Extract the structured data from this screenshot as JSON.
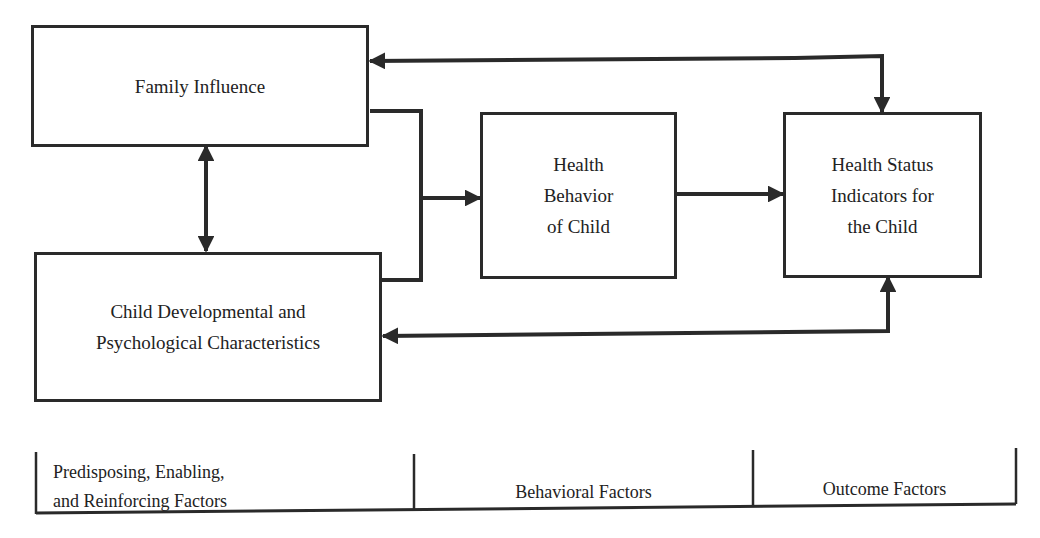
{
  "diagram": {
    "boxes": {
      "family_influence": {
        "lines": [
          "Family Influence"
        ]
      },
      "child_characteristics": {
        "lines": [
          "Child Developmental and",
          "Psychological Characteristics"
        ]
      },
      "health_behavior": {
        "lines": [
          "Health",
          "Behavior",
          "of Child"
        ]
      },
      "health_status": {
        "lines": [
          "Health Status",
          "Indicators for",
          "the Child"
        ]
      }
    },
    "edges": [
      {
        "from": "family_influence",
        "to": "child_characteristics",
        "type": "bidirectional"
      },
      {
        "from": "family_influence",
        "to": "health_behavior",
        "type": "merged-directed"
      },
      {
        "from": "child_characteristics",
        "to": "health_behavior",
        "type": "merged-directed"
      },
      {
        "from": "health_behavior",
        "to": "health_status",
        "type": "directed"
      },
      {
        "from": "health_status",
        "to": "family_influence",
        "type": "bidirectional"
      },
      {
        "from": "health_status",
        "to": "child_characteristics",
        "type": "bidirectional"
      }
    ],
    "stroke_color": "#2a2a2a"
  },
  "footer": {
    "categories": [
      {
        "lines": [
          "Predisposing, Enabling,",
          "and Reinforcing Factors"
        ]
      },
      {
        "lines": [
          "Behavioral Factors"
        ]
      },
      {
        "lines": [
          "Outcome Factors"
        ]
      }
    ]
  }
}
